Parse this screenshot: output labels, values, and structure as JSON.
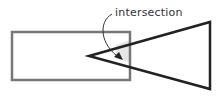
{
  "diagram": {
    "annotation": "intersection",
    "colors": {
      "rect_stroke": "#777777",
      "triangle_stroke": "#222222",
      "intersection_fill": "#e6e6e6",
      "arrow": "#333333"
    }
  }
}
